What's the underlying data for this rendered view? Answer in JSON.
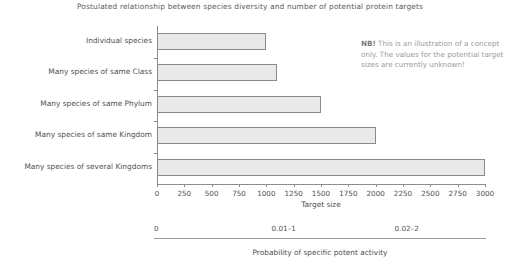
{
  "chart_data": {
    "type": "bar",
    "orientation": "horizontal",
    "title": "Postulated relationship between species diversity and number of potential protein targets",
    "categories": [
      "Individual species",
      "Many species of same Class",
      "Many species of same Phylum",
      "Many species of same Kingdom",
      "Many species of several Kingdoms"
    ],
    "values": [
      1000,
      1100,
      1500,
      2000,
      3000
    ],
    "xlabel": "Target size",
    "ylabel": "",
    "xlim": [
      0,
      3000
    ],
    "xticks": [
      0,
      250,
      500,
      750,
      1000,
      1250,
      1500,
      1750,
      2000,
      2250,
      2500,
      2750,
      3000
    ],
    "xtick_labels": [
      "0",
      "250",
      "500",
      "750",
      "1000",
      "1250",
      "1500",
      "1750",
      "2000",
      "2250",
      "2500",
      "2750",
      "3000"
    ],
    "grid": false,
    "legend": null,
    "bar_fill_color": "#e9e9e9",
    "bar_border_color": "#8a8a8a",
    "annotations": [
      {
        "name": "nb-note",
        "lead": "NB!",
        "text": "This is an illustration of a concept only. The values for the potential target sizes are currently unknown!"
      }
    ],
    "secondary_axis": {
      "label": "Probability of specific potent activity",
      "tick_labels": [
        "0",
        "0.01–1",
        "0.02–2"
      ],
      "tick_positions": [
        0,
        1075,
        2200
      ]
    }
  }
}
